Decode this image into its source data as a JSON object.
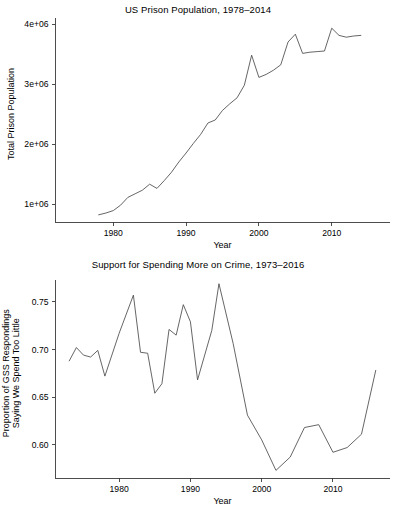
{
  "figure": {
    "width": 396,
    "height": 511,
    "background": "#ffffff",
    "line_color": "#4a4a4a",
    "axis_color": "#3a3a3a",
    "text_color": "#000000"
  },
  "chart_data": [
    {
      "id": "us-prison-population",
      "type": "line",
      "title": "US Prison Population, 1978–2014",
      "xlabel": "Year",
      "ylabel": "Total Prison Population",
      "xlim": [
        1972,
        2018
      ],
      "ylim": [
        700000,
        4050000
      ],
      "grid": false,
      "legend": false,
      "xticks": [
        1980,
        1990,
        2000,
        2010
      ],
      "xticklabels": [
        "1980",
        "1990",
        "2000",
        "2010"
      ],
      "yticks": [
        1000000,
        2000000,
        3000000,
        4000000
      ],
      "yticklabels": [
        "1e+06",
        "2e+06",
        "3e+06",
        "4e+06"
      ],
      "x": [
        1978,
        1979,
        1980,
        1981,
        1982,
        1983,
        1984,
        1985,
        1986,
        1987,
        1988,
        1989,
        1990,
        1991,
        1992,
        1993,
        1994,
        1995,
        1996,
        1997,
        1998,
        1999,
        2000,
        2001,
        2002,
        2003,
        2004,
        2005,
        2006,
        2007,
        2008,
        2009,
        2010,
        2011,
        2012,
        2013,
        2014
      ],
      "values": [
        820000,
        850000,
        890000,
        980000,
        1110000,
        1170000,
        1230000,
        1330000,
        1260000,
        1390000,
        1530000,
        1700000,
        1850000,
        2010000,
        2160000,
        2350000,
        2400000,
        2560000,
        2670000,
        2770000,
        2980000,
        3480000,
        3110000,
        3160000,
        3230000,
        3320000,
        3700000,
        3830000,
        3510000,
        3530000,
        3540000,
        3550000,
        3930000,
        3810000,
        3780000,
        3800000,
        3810000
      ]
    },
    {
      "id": "support-spending-more-on-crime",
      "type": "line",
      "title": "Support for Spending More on Crime, 1973–2016",
      "xlabel": "Year",
      "ylabel": "Proportion of GSS Respondings\nSaying We Spend Too Little",
      "ylabel_line1": "Proportion of GSS Respondings",
      "ylabel_line2": "Saying We Spend Too Little",
      "xlim": [
        1971,
        2018
      ],
      "ylim": [
        0.565,
        0.775
      ],
      "grid": false,
      "legend": false,
      "xticks": [
        1980,
        1990,
        2000,
        2010
      ],
      "xticklabels": [
        "1980",
        "1990",
        "2000",
        "2010"
      ],
      "yticks": [
        0.6,
        0.65,
        0.7,
        0.75
      ],
      "yticklabels": [
        "0.60",
        "0.65",
        "0.70",
        "0.75"
      ],
      "x": [
        1973,
        1974,
        1975,
        1976,
        1977,
        1978,
        1980,
        1982,
        1983,
        1984,
        1985,
        1986,
        1987,
        1988,
        1989,
        1990,
        1991,
        1993,
        1994,
        1996,
        1998,
        2000,
        2002,
        2004,
        2006,
        2008,
        2010,
        2012,
        2014,
        2016
      ],
      "values": [
        0.688,
        0.702,
        0.694,
        0.692,
        0.699,
        0.672,
        0.717,
        0.757,
        0.697,
        0.696,
        0.654,
        0.664,
        0.721,
        0.715,
        0.747,
        0.729,
        0.668,
        0.72,
        0.769,
        0.706,
        0.631,
        0.605,
        0.573,
        0.587,
        0.618,
        0.621,
        0.592,
        0.597,
        0.611,
        0.678
      ]
    }
  ]
}
